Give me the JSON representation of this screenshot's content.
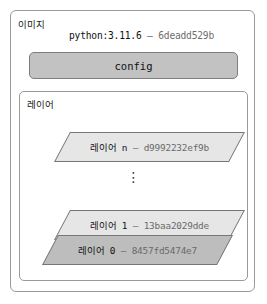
{
  "image": {
    "label": "이미지",
    "tag_name": "python:3.11.6",
    "tag_separator": "–",
    "tag_id": "6deadd529b",
    "config_label": "config"
  },
  "layers": {
    "label": "레이어",
    "ellipsis": "⋮",
    "items": [
      {
        "name": "레이어 n",
        "separator": "–",
        "id": "d9992232ef9b",
        "fill": "#e6e6e6"
      },
      {
        "name": "레이어 1",
        "separator": "–",
        "id": "13baa2029dde",
        "fill": "#e6e6e6"
      },
      {
        "name": "레이어 0",
        "separator": "–",
        "id": "8457fd5474e7",
        "fill": "#bdbdbd"
      }
    ]
  },
  "colors": {
    "border": "#9a9a9a",
    "config_fill": "#c2c2c2",
    "layer_light": "#e6e6e6",
    "layer_dark": "#bdbdbd",
    "text": "#111111",
    "text_dim": "#6a6a6a"
  }
}
